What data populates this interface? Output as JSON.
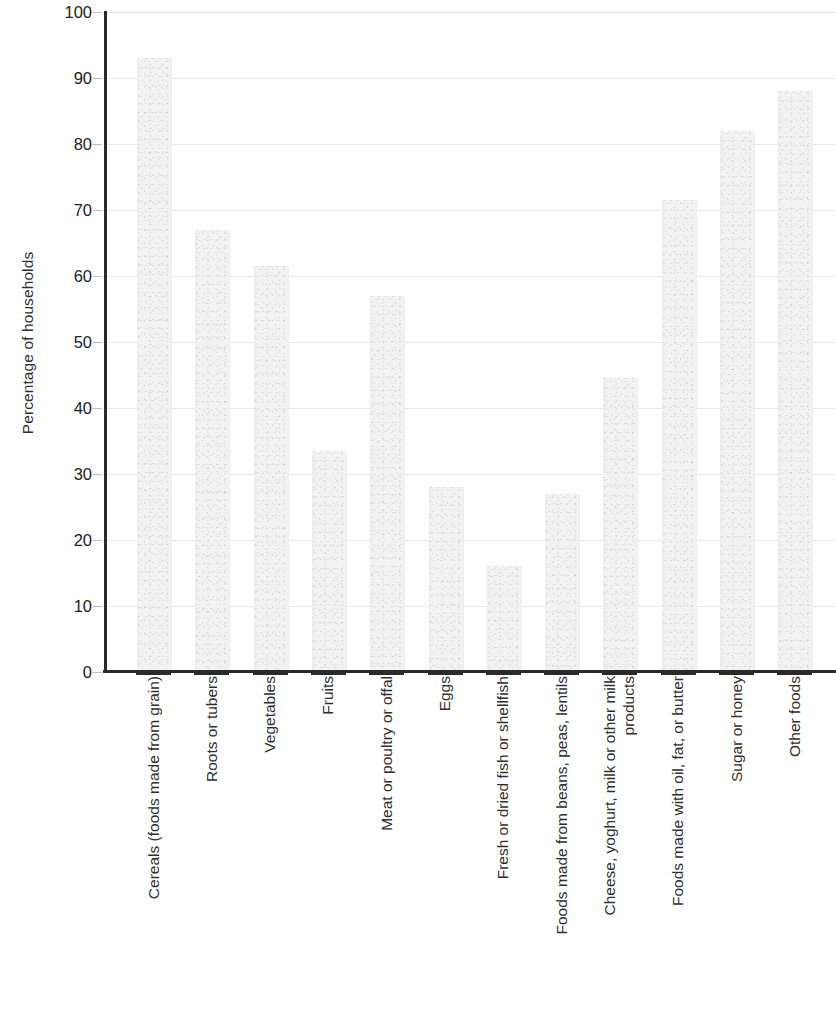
{
  "chart_data": {
    "type": "bar",
    "title": "",
    "subtitle": "",
    "xlabel": "",
    "ylabel": "Percentage of households",
    "ylim": [
      0,
      100
    ],
    "ytick_step": 10,
    "yticks": [
      "100",
      "90",
      "80",
      "70",
      "60",
      "50",
      "40",
      "30",
      "20",
      "10",
      "0"
    ],
    "grid": true,
    "legend": false,
    "legend_position": "none",
    "orientation": "vertical",
    "bar_color": "#f2f2f2",
    "axis_color": "#2a2a2a",
    "gridline_color": "#e9e9e9",
    "categories": [
      "Cereals  (foods made from grain)",
      "Roots or tubers",
      "Vegetables",
      "Fruits",
      "Meat or poultry or offal",
      "Eggs",
      "Fresh or dried fish or shellfish",
      "Foods made from beans, peas, lentils",
      "Cheese, yoghurt, milk or other milk products",
      "Foods made with oil, fat, or butter",
      "Sugar or honey",
      "Other foods"
    ],
    "values": [
      93,
      67,
      61.5,
      33.5,
      57,
      28,
      16,
      27,
      44.5,
      71.5,
      82,
      88
    ]
  }
}
